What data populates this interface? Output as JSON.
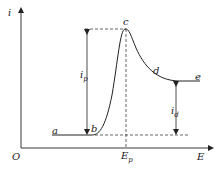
{
  "figure": {
    "type": "diagram",
    "axes": {
      "y_label": "i",
      "x_label": "E",
      "origin_label": "O"
    },
    "points": {
      "a": "a",
      "b": "b",
      "c": "c",
      "d": "d",
      "e": "e"
    },
    "annotations": {
      "peak_current": {
        "main": "i",
        "sub": "p"
      },
      "diffusion_current": {
        "main": "i",
        "sub": "d"
      },
      "peak_potential": {
        "main": "E",
        "sub": "p"
      }
    },
    "colors": {
      "line": "#222222",
      "background": "#ffffff"
    }
  }
}
